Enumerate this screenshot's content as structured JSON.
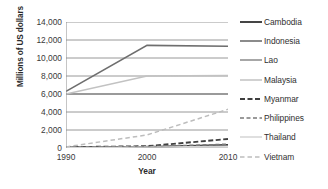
{
  "chart_data": {
    "type": "line",
    "title": "",
    "xlabel": "Year",
    "ylabel": "Millions of US dollars",
    "x": [
      1990,
      2000,
      2010
    ],
    "xtick_labels": [
      "1990",
      "2000",
      "2010"
    ],
    "ytick_labels": [
      "0",
      "2,000",
      "4,000",
      "6,000",
      "8,000",
      "10,000",
      "12,000",
      "14,000"
    ],
    "ytick_values": [
      0,
      2000,
      4000,
      6000,
      8000,
      10000,
      12000,
      14000
    ],
    "xlim": [
      1990,
      2010
    ],
    "ylim": [
      0,
      14000
    ],
    "grid": "horizontal",
    "legend_position": "right",
    "series": [
      {
        "name": "Cambodia",
        "values": [
          60,
          120,
          330
        ],
        "color": "#3b3b3b",
        "dash": "none",
        "width": 1.9
      },
      {
        "name": "Indonesia",
        "values": [
          6300,
          11400,
          11300
        ],
        "color": "#6e6e6e",
        "dash": "none",
        "width": 1.6
      },
      {
        "name": "Lao",
        "values": [
          6000,
          6000,
          6000
        ],
        "color": "#8a8a8a",
        "dash": "none",
        "width": 1.3
      },
      {
        "name": "Malaysia",
        "values": [
          6000,
          8000,
          8050
        ],
        "color": "#c2c2c2",
        "dash": "none",
        "width": 1.4
      },
      {
        "name": "Myanmar",
        "values": [
          90,
          200,
          1000
        ],
        "color": "#3f3f3f",
        "dash": "5,2.5",
        "width": 1.9
      },
      {
        "name": "Philippines",
        "values": [
          80,
          160,
          430
        ],
        "color": "#7a7a7a",
        "dash": "4,2.5",
        "width": 1.4
      },
      {
        "name": "Thailand",
        "values": [
          40,
          90,
          200
        ],
        "color": "#d5d5d5",
        "dash": "none",
        "width": 1.3
      },
      {
        "name": "Vietnam",
        "values": [
          120,
          1450,
          4300
        ],
        "color": "#bdbdbd",
        "dash": "4.5,3",
        "width": 1.5
      }
    ]
  },
  "axes": {
    "grid_color": "#8c8c8c",
    "axis_color": "#8c8c8c",
    "text_color": "#3a3a3a"
  }
}
